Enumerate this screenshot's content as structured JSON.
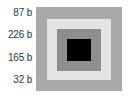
{
  "labels": [
    {
      "text": "87 b"
    },
    {
      "text": "226 b"
    },
    {
      "text": "165 b"
    },
    {
      "text": "32 b"
    }
  ],
  "squares": [
    {
      "name": "outer",
      "color": "#a9a9a9"
    },
    {
      "name": "second",
      "color": "#e4e4e4"
    },
    {
      "name": "third",
      "color": "#8e8e8e"
    },
    {
      "name": "inner",
      "color": "#000000"
    }
  ]
}
